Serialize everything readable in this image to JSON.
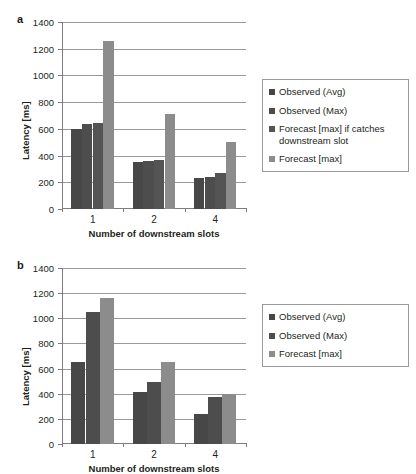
{
  "figure": {
    "panels": [
      {
        "label": "a",
        "ylabel": "Latency [ms]",
        "xlabel": "Number of downstream slots"
      },
      {
        "label": "b",
        "ylabel": "Latency [ms]",
        "xlabel": "Number of downstream slots"
      }
    ]
  },
  "colors": {
    "series_dark1": "#474747",
    "series_dark2": "#4d4d4d",
    "series_dark3": "#545454",
    "series_light": "#8c8c8c",
    "grid": "#9a9a9a",
    "axis": "#7d7d7d",
    "text": "#231f20",
    "background": "#ffffff"
  },
  "chart_data": [
    {
      "type": "bar",
      "panel": "a",
      "title": "",
      "xlabel": "Number of downstream slots",
      "ylabel": "Latency [ms]",
      "categories": [
        "1",
        "2",
        "4"
      ],
      "yticks": [
        0,
        200,
        400,
        600,
        800,
        1000,
        1200,
        1400
      ],
      "ylim": [
        0,
        1400
      ],
      "grid": true,
      "legend_position": "right",
      "series": [
        {
          "name": "Observed (Avg)",
          "color": "#474747",
          "values": [
            600,
            350,
            230
          ]
        },
        {
          "name": "Observed (Max)",
          "color": "#4d4d4d",
          "values": [
            640,
            360,
            240
          ]
        },
        {
          "name": "Forecast [max] if catches downstream slot",
          "color": "#545454",
          "values": [
            645,
            365,
            270
          ]
        },
        {
          "name": "Forecast [max]",
          "color": "#8c8c8c",
          "values": [
            1260,
            710,
            500
          ]
        }
      ]
    },
    {
      "type": "bar",
      "panel": "b",
      "title": "",
      "xlabel": "Number of downstream slots",
      "ylabel": "Latency [ms]",
      "categories": [
        "1",
        "2",
        "4"
      ],
      "yticks": [
        0,
        200,
        400,
        600,
        800,
        1000,
        1200,
        1400
      ],
      "ylim": [
        0,
        1400
      ],
      "grid": true,
      "legend_position": "right",
      "series": [
        {
          "name": "Observed (Avg)",
          "color": "#474747",
          "values": [
            650,
            415,
            240
          ]
        },
        {
          "name": "Observed (Max)",
          "color": "#4d4d4d",
          "values": [
            1050,
            495,
            375
          ]
        },
        {
          "name": "Forecast [max]",
          "color": "#8c8c8c",
          "values": [
            1160,
            650,
            400
          ]
        }
      ]
    }
  ]
}
